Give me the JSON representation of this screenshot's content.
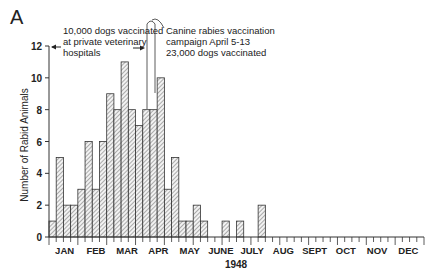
{
  "chart_data": {
    "type": "bar",
    "panel_label": "A",
    "title": "",
    "xlabel": "1948",
    "ylabel": "Number of Rabid Animals",
    "ylim": [
      0,
      12
    ],
    "yticks": [
      0,
      2,
      4,
      6,
      8,
      10,
      12
    ],
    "grid": false,
    "bin": "week",
    "months": [
      "JAN",
      "FEB",
      "MAR",
      "APR",
      "MAY",
      "JUNE",
      "JULY",
      "AUG",
      "SEPT",
      "OCT",
      "NOV",
      "DEC"
    ],
    "weeks": [
      1,
      2,
      3,
      4,
      5,
      6,
      7,
      8,
      9,
      10,
      11,
      12,
      13,
      14,
      15,
      16,
      17,
      18,
      19,
      20,
      21,
      22,
      23,
      24,
      25,
      26,
      27,
      28,
      29,
      30,
      31,
      32,
      33,
      34,
      35,
      36,
      37,
      38,
      39,
      40,
      41,
      42,
      43,
      44,
      45,
      46,
      47,
      48,
      49,
      50,
      51,
      52
    ],
    "values": [
      1,
      5,
      2,
      2,
      3,
      6,
      3,
      6,
      9,
      8,
      11,
      8,
      7,
      8,
      8,
      10,
      3,
      5,
      1,
      1,
      2,
      1,
      0,
      0,
      1,
      0,
      1,
      0,
      0,
      2,
      0,
      0,
      0,
      0,
      0,
      0,
      0,
      0,
      0,
      0,
      0,
      0,
      0,
      0,
      0,
      0,
      0,
      0,
      0,
      0,
      0,
      0
    ],
    "annotations": [
      {
        "id": "private",
        "lines": [
          "10,000 dogs vaccinated",
          "at private veterinary",
          "hospitals"
        ]
      },
      {
        "id": "campaign",
        "lines": [
          "Canine rabies vaccination",
          "campaign April 5-13",
          "23,000 dogs vaccinated"
        ]
      }
    ]
  }
}
